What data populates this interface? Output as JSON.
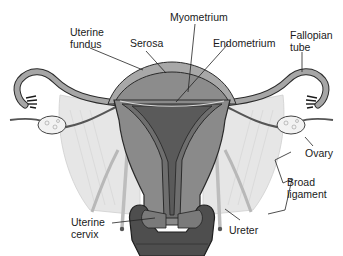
{
  "diagram": {
    "labels": {
      "uterine_fundus": "Uterine\nfundus",
      "serosa": "Serosa",
      "myometrium": "Myometrium",
      "endometrium": "Endometrium",
      "fallopian_tube": "Fallopian\ntube",
      "ovary": "Ovary",
      "broad_ligament": "Broad\nligament",
      "ureter": "Ureter",
      "uterine_cervix": "Uterine\ncervix"
    },
    "colors": {
      "serosa": "#a8a8a8",
      "myometrium": "#8a8a8a",
      "endometrium": "#6e6e6e",
      "cavity": "#5a5a5a",
      "broad_ligament": "#e4e4e4",
      "ovary": "#f2f2f2",
      "outline": "#2a2a2a"
    }
  }
}
